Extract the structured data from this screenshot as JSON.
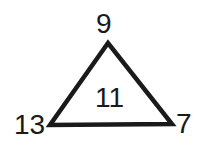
{
  "diagram": {
    "type": "number-triangle",
    "vertices": {
      "top": "9",
      "bottom_left": "13",
      "bottom_right": "7"
    },
    "center": "11",
    "stroke_color": "#1a1a1a",
    "background_color": "#ffffff"
  }
}
